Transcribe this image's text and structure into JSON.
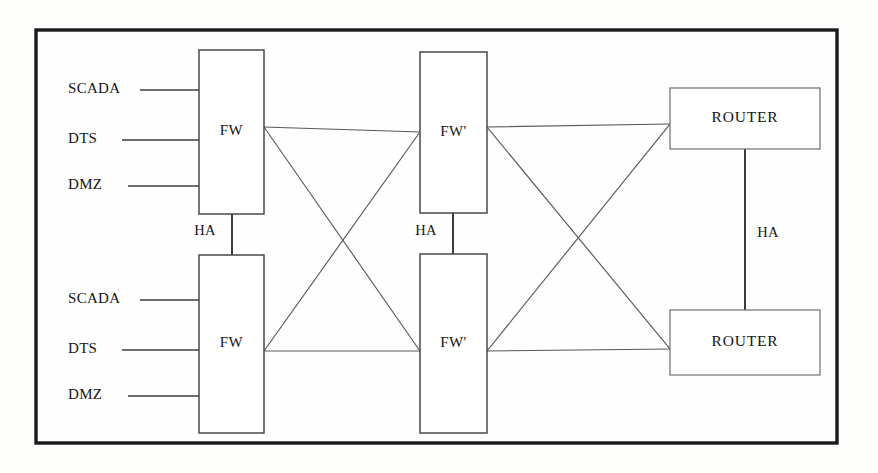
{
  "diagram": {
    "frame": {
      "x": 36,
      "y": 30,
      "width": 801,
      "height": 413,
      "stroke": "#1a1a1a"
    },
    "colors": {
      "background": "#fdfdfc",
      "frame_stroke": "#1a1a1a",
      "box_stroke": "#4a4a4a",
      "router_box_stroke": "#6e6e6e",
      "link_stroke": "#5a5a5a",
      "feed_stroke": "#3c3c3c",
      "text": "#151515"
    },
    "nodes": [
      {
        "id": "fw-top",
        "label": "FW",
        "x": 199,
        "y": 50,
        "width": 65,
        "height": 164,
        "type": "firewall"
      },
      {
        "id": "fw-bottom",
        "label": "FW",
        "x": 199,
        "y": 255,
        "width": 65,
        "height": 178,
        "type": "firewall"
      },
      {
        "id": "fwp-top",
        "label": "FW'",
        "x": 420,
        "y": 52,
        "width": 67,
        "height": 161,
        "type": "firewall-prime"
      },
      {
        "id": "fwp-bottom",
        "label": "FW'",
        "x": 420,
        "y": 254,
        "width": 67,
        "height": 179,
        "type": "firewall-prime"
      },
      {
        "id": "router-top",
        "label": "ROUTER",
        "x": 670,
        "y": 88,
        "width": 150,
        "height": 61,
        "type": "router"
      },
      {
        "id": "router-bottom",
        "label": "ROUTER",
        "x": 670,
        "y": 310,
        "width": 150,
        "height": 65,
        "type": "router"
      }
    ],
    "feeds": [
      {
        "label": "SCADA",
        "group": "top",
        "label_x": 68,
        "y": 90,
        "line_x1": 140,
        "line_x2": 199
      },
      {
        "label": "DTS",
        "group": "top",
        "label_x": 68,
        "y": 140,
        "line_x1": 122,
        "line_x2": 199
      },
      {
        "label": "DMZ",
        "group": "top",
        "label_x": 68,
        "y": 186,
        "line_x1": 128,
        "line_x2": 199
      },
      {
        "label": "SCADA",
        "group": "bottom",
        "label_x": 68,
        "y": 300,
        "line_x1": 140,
        "line_x2": 199
      },
      {
        "label": "DTS",
        "group": "bottom",
        "label_x": 68,
        "y": 350,
        "line_x1": 122,
        "line_x2": 199
      },
      {
        "label": "DMZ",
        "group": "bottom",
        "label_x": 68,
        "y": 396,
        "line_x1": 128,
        "line_x2": 199
      }
    ],
    "ha_links": [
      {
        "id": "ha-fw",
        "label": "HA",
        "x": 232,
        "y1": 214,
        "y2": 255,
        "label_x": 205,
        "label_y": 232
      },
      {
        "id": "ha-fwp",
        "label": "HA",
        "x": 453,
        "y1": 213,
        "y2": 254,
        "label_x": 426,
        "label_y": 232
      },
      {
        "id": "ha-router",
        "label": "HA",
        "x": 745,
        "y1": 149,
        "y2": 310,
        "label_x": 768,
        "label_y": 234
      }
    ],
    "mesh_links": [
      {
        "from": "fw-top",
        "to": "fwp-top",
        "x1": 264,
        "y1": 127,
        "x2": 420,
        "y2": 132
      },
      {
        "from": "fw-top",
        "to": "fwp-bottom",
        "x1": 264,
        "y1": 127,
        "x2": 420,
        "y2": 351
      },
      {
        "from": "fw-bottom",
        "to": "fwp-top",
        "x1": 264,
        "y1": 351,
        "x2": 420,
        "y2": 132
      },
      {
        "from": "fw-bottom",
        "to": "fwp-bottom",
        "x1": 264,
        "y1": 351,
        "x2": 420,
        "y2": 351
      },
      {
        "from": "fwp-top",
        "to": "router-top",
        "x1": 487,
        "y1": 127,
        "x2": 670,
        "y2": 124
      },
      {
        "from": "fwp-top",
        "to": "router-bottom",
        "x1": 487,
        "y1": 127,
        "x2": 670,
        "y2": 349
      },
      {
        "from": "fwp-bottom",
        "to": "router-top",
        "x1": 487,
        "y1": 351,
        "x2": 670,
        "y2": 124
      },
      {
        "from": "fwp-bottom",
        "to": "router-bottom",
        "x1": 487,
        "y1": 351,
        "x2": 670,
        "y2": 349
      }
    ]
  }
}
